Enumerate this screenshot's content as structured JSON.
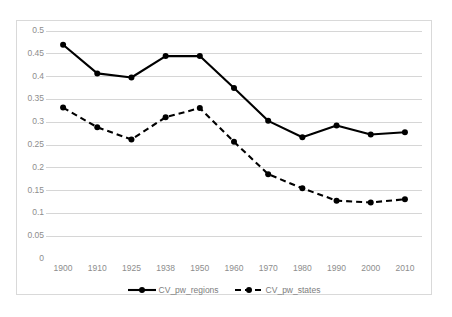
{
  "chart_data": {
    "type": "line",
    "title": "",
    "subtitle": "",
    "xlabel": "",
    "ylabel": "",
    "categories": [
      "1900",
      "1910",
      "1925",
      "1938",
      "1950",
      "1960",
      "1970",
      "1980",
      "1990",
      "2000",
      "2010"
    ],
    "series": [
      {
        "name": "CV_pw_regions",
        "style": "solid",
        "marker": "circle",
        "color": "#000000",
        "values": [
          0.47,
          0.407,
          0.398,
          0.445,
          0.445,
          0.375,
          0.303,
          0.267,
          0.293,
          0.273,
          0.278
        ]
      },
      {
        "name": "CV_pw_states",
        "style": "dashed",
        "marker": "circle",
        "color": "#000000",
        "values": [
          0.332,
          0.289,
          0.262,
          0.311,
          0.331,
          0.257,
          0.186,
          0.155,
          0.128,
          0.124,
          0.131
        ]
      }
    ],
    "ylim": [
      0,
      0.5
    ],
    "ytick_values": [
      0,
      0.05,
      0.1,
      0.15,
      0.2,
      0.25,
      0.3,
      0.35,
      0.4,
      0.45,
      0.5
    ],
    "ytick_labels": [
      "0",
      "0.05",
      "0.1",
      "0.15",
      "0.2",
      "0.25",
      "0.3",
      "0.35",
      "0.4",
      "0.45",
      "0.5"
    ],
    "grid": true,
    "grid_axis": "y",
    "legend_position": "bottom",
    "legend_entries": [
      "CV_pw_regions",
      "CV_pw_states"
    ]
  },
  "colors": {
    "background": "#ffffff",
    "frame_border": "#d9d9d9",
    "gridline": "#d6d6d6",
    "tick_text": "#8d8d8d",
    "legend_text": "#7d7d7d",
    "series": "#000000"
  }
}
